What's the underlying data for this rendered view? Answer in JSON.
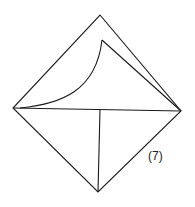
{
  "diagram": {
    "step_label": "(7)",
    "stroke_color": "#1a1a1a",
    "background": "#ffffff",
    "points": {
      "top": [
        100,
        15
      ],
      "left": [
        13,
        108
      ],
      "right": [
        181,
        111
      ],
      "bottom": [
        98,
        192
      ],
      "inner_peak": [
        102,
        40
      ],
      "center": [
        100,
        109
      ]
    }
  }
}
